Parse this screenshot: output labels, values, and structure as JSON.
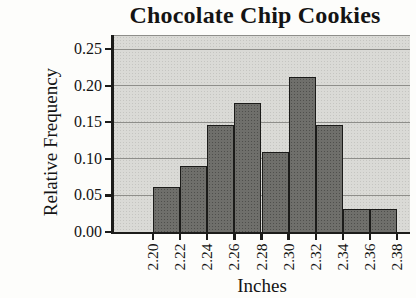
{
  "figure": {
    "title": "Chocolate Chip Cookies",
    "x_axis_label": "Inches",
    "y_axis_label": "Relative Frequency"
  },
  "chart_data": {
    "type": "bar",
    "subtype": "histogram",
    "title": "Chocolate Chip Cookies",
    "xlabel": "Inches",
    "ylabel": "Relative Frequency",
    "bin_width": 0.02,
    "bin_edges": [
      2.2,
      2.22,
      2.24,
      2.26,
      2.28,
      2.3,
      2.32,
      2.34,
      2.36,
      2.38
    ],
    "x_tick_labels": [
      "2.20",
      "2.22",
      "2.24",
      "2.26",
      "2.28",
      "2.30",
      "2.32",
      "2.34",
      "2.36",
      "2.38"
    ],
    "values": [
      0.061,
      0.09,
      0.147,
      0.177,
      0.11,
      0.212,
      0.147,
      0.031,
      0.031
    ],
    "y_tick_labels": [
      "0.25",
      "0.20",
      "0.15",
      "0.10",
      "0.05",
      "0.00"
    ],
    "y_tick_values": [
      0.25,
      0.2,
      0.15,
      0.1,
      0.05,
      0.0
    ],
    "ylim": [
      0,
      0.268
    ],
    "grid": true,
    "legend_position": "none",
    "colors": {
      "bar_fill": "#6f6f6b",
      "bar_border": "#1b1b19",
      "plot_background": "#dadad6",
      "gridline": "#8e8e8a",
      "axis_line": "#1c1c1a",
      "page_background": "#fdfdfb",
      "text": "#141414"
    }
  }
}
